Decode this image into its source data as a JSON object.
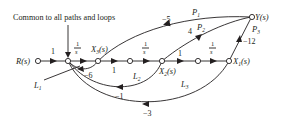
{
  "diagram": {
    "type": "signal-flow-graph",
    "annotation": "Common to all paths and loops",
    "nodes": {
      "input": "R(s)",
      "x3": "X",
      "x3_sub": "3",
      "x2": "X",
      "x2_sub": "2",
      "x1": "X",
      "x1_sub": "1",
      "output": "Y(s)",
      "arg": "(s)"
    },
    "forward_gains": {
      "r_to_n1": "1",
      "n1_to_x3_num": "1",
      "n1_to_x3_den": "s",
      "x3_to_n3": "1",
      "n3_to_x2_num": "1",
      "n3_to_x2_den": "s",
      "x2_to_n5": "1",
      "n5_to_x1_num": "1",
      "n5_to_x1_den": "s"
    },
    "paths": [
      {
        "label": "P",
        "sub": "1",
        "gain": "−5",
        "from": "X3(s)",
        "to": "Y(s)"
      },
      {
        "label": "P",
        "sub": "2",
        "gain": "4",
        "from": "X2(s)",
        "to": "Y(s)"
      },
      {
        "label": "P",
        "sub": "3",
        "gain": "−12",
        "from": "X1(s)",
        "to": "Y(s)"
      }
    ],
    "loops": [
      {
        "label": "L",
        "sub": "1",
        "gain": "−6",
        "from": "X3(s)"
      },
      {
        "label": "L",
        "sub": "2",
        "gain": "−1",
        "from": "X2(s)"
      },
      {
        "label": "L",
        "sub": "3",
        "gain": "−3",
        "from": "X1(s)"
      }
    ]
  }
}
